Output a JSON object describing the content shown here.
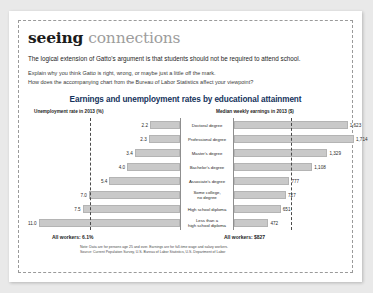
{
  "feature": {
    "title_word_1": "seeing",
    "title_word_2": "connections",
    "lede": "The logical extension of Gatto's argument is that students should not be required to attend school.",
    "prompt_line_1": "Explain why you think Gatto is right, wrong, or maybe just a little off the mark.",
    "prompt_line_2": "How does the accompanying chart from the Bureau of Labor Statistics affect your viewpoint?"
  },
  "chart_data": {
    "type": "bar",
    "title": "Earnings and unemployment rates by educational attainment",
    "left_axis_header": "Unemployment rate in 2013 (%)",
    "right_axis_header": "Median weekly earnings in 2013 ($)",
    "categories": [
      "Doctoral degree",
      "Professional degree",
      "Master's degree",
      "Bachelor's degree",
      "Associate's degree",
      "Some college, no degree",
      "High school diploma",
      "Less than a high school diploma"
    ],
    "series": [
      {
        "name": "Unemployment rate in 2013 (%)",
        "values": [
          2.2,
          2.3,
          3.4,
          4.0,
          5.4,
          7.0,
          7.5,
          11.0
        ],
        "direction": "left",
        "max": 11.0
      },
      {
        "name": "Median weekly earnings in 2013 ($)",
        "values": [
          1623,
          1714,
          1329,
          1108,
          777,
          727,
          651,
          472
        ],
        "direction": "right",
        "max": 1714
      }
    ],
    "value_labels_left": [
      "2.2",
      "2.3",
      "3.4",
      "4.0",
      "5.4",
      "7.0",
      "7.5",
      "11.0"
    ],
    "value_labels_right": [
      "1,623",
      "1,714",
      "1,329",
      "1,108",
      "777",
      "727",
      "651",
      "472"
    ],
    "reference_lines": [
      {
        "side": "left",
        "label": "All workers: 6.1%",
        "value": 6.1
      },
      {
        "side": "right",
        "label": "All workers: $827",
        "value": 827
      }
    ],
    "all_workers_left": "All workers: 6.1%",
    "all_workers_right": "All workers: $827",
    "note": "Note: Data are for persons age 25 and over. Earnings are for full-time wage and salary workers.",
    "source": "Source: Current Population Survey, U.S. Bureau of Labor Statistics, U.S. Department of Labor",
    "bar_color": "#c9c9c9",
    "title_color": "#15335c",
    "grid": false,
    "legend": "none"
  }
}
